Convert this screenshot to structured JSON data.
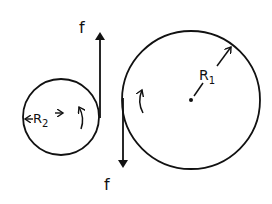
{
  "diagram": {
    "type": "two-pulley-friction",
    "colors": {
      "stroke": "#111111",
      "background": "#ffffff"
    },
    "small_circle": {
      "label": "R",
      "subscript": "2",
      "rotation": "counterclockwise-arrow"
    },
    "large_circle": {
      "label": "R",
      "subscript": "1",
      "rotation": "counterclockwise-arrow"
    },
    "forces": [
      {
        "label": "f",
        "direction": "up"
      },
      {
        "label": "f",
        "direction": "down"
      }
    ]
  }
}
